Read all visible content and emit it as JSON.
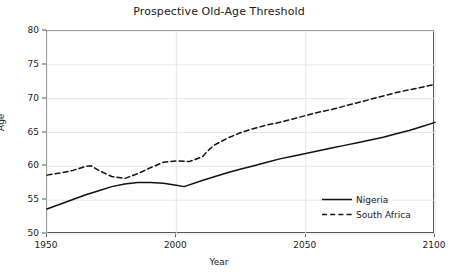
{
  "chart_data": {
    "type": "line",
    "title": "Prospective Old-Age Threshold",
    "xlabel": "Year",
    "ylabel": "Age",
    "xlim": [
      1950,
      2100
    ],
    "ylim": [
      50,
      80
    ],
    "xticks": [
      1950,
      2000,
      2050,
      2100
    ],
    "yticks": [
      50,
      55,
      60,
      65,
      70,
      75,
      80
    ],
    "grid": true,
    "legend_position": "lower right",
    "series": [
      {
        "name": "Nigeria",
        "style": "solid",
        "color": "#111111",
        "x": [
          1950,
          1955,
          1960,
          1965,
          1970,
          1975,
          1980,
          1985,
          1990,
          1995,
          2000,
          2003,
          2010,
          2015,
          2020,
          2025,
          2030,
          2035,
          2040,
          2045,
          2050,
          2055,
          2060,
          2065,
          2070,
          2075,
          2080,
          2085,
          2090,
          2095,
          2100
        ],
        "y": [
          53.7,
          54.4,
          55.1,
          55.8,
          56.4,
          57.0,
          57.4,
          57.6,
          57.6,
          57.5,
          57.2,
          57.0,
          57.9,
          58.5,
          59.1,
          59.6,
          60.1,
          60.6,
          61.1,
          61.5,
          61.9,
          62.3,
          62.7,
          63.1,
          63.5,
          63.9,
          64.3,
          64.8,
          65.3,
          65.9,
          66.5
        ]
      },
      {
        "name": "South Africa",
        "style": "dashed",
        "color": "#111111",
        "x": [
          1950,
          1955,
          1960,
          1965,
          1967,
          1970,
          1975,
          1980,
          1985,
          1990,
          1995,
          2000,
          2005,
          2010,
          2013,
          2015,
          2020,
          2025,
          2030,
          2035,
          2040,
          2045,
          2050,
          2055,
          2060,
          2065,
          2070,
          2075,
          2080,
          2085,
          2090,
          2095,
          2100
        ],
        "y": [
          58.7,
          59.0,
          59.4,
          60.0,
          60.1,
          59.4,
          58.5,
          58.2,
          58.9,
          59.8,
          60.6,
          60.8,
          60.7,
          61.4,
          62.6,
          63.2,
          64.2,
          65.0,
          65.6,
          66.1,
          66.5,
          67.0,
          67.5,
          68.0,
          68.4,
          68.9,
          69.4,
          69.9,
          70.4,
          70.9,
          71.3,
          71.7,
          72.1
        ]
      }
    ]
  },
  "legend": {
    "items": [
      {
        "label": "Nigeria"
      },
      {
        "label": "South Africa"
      }
    ]
  }
}
